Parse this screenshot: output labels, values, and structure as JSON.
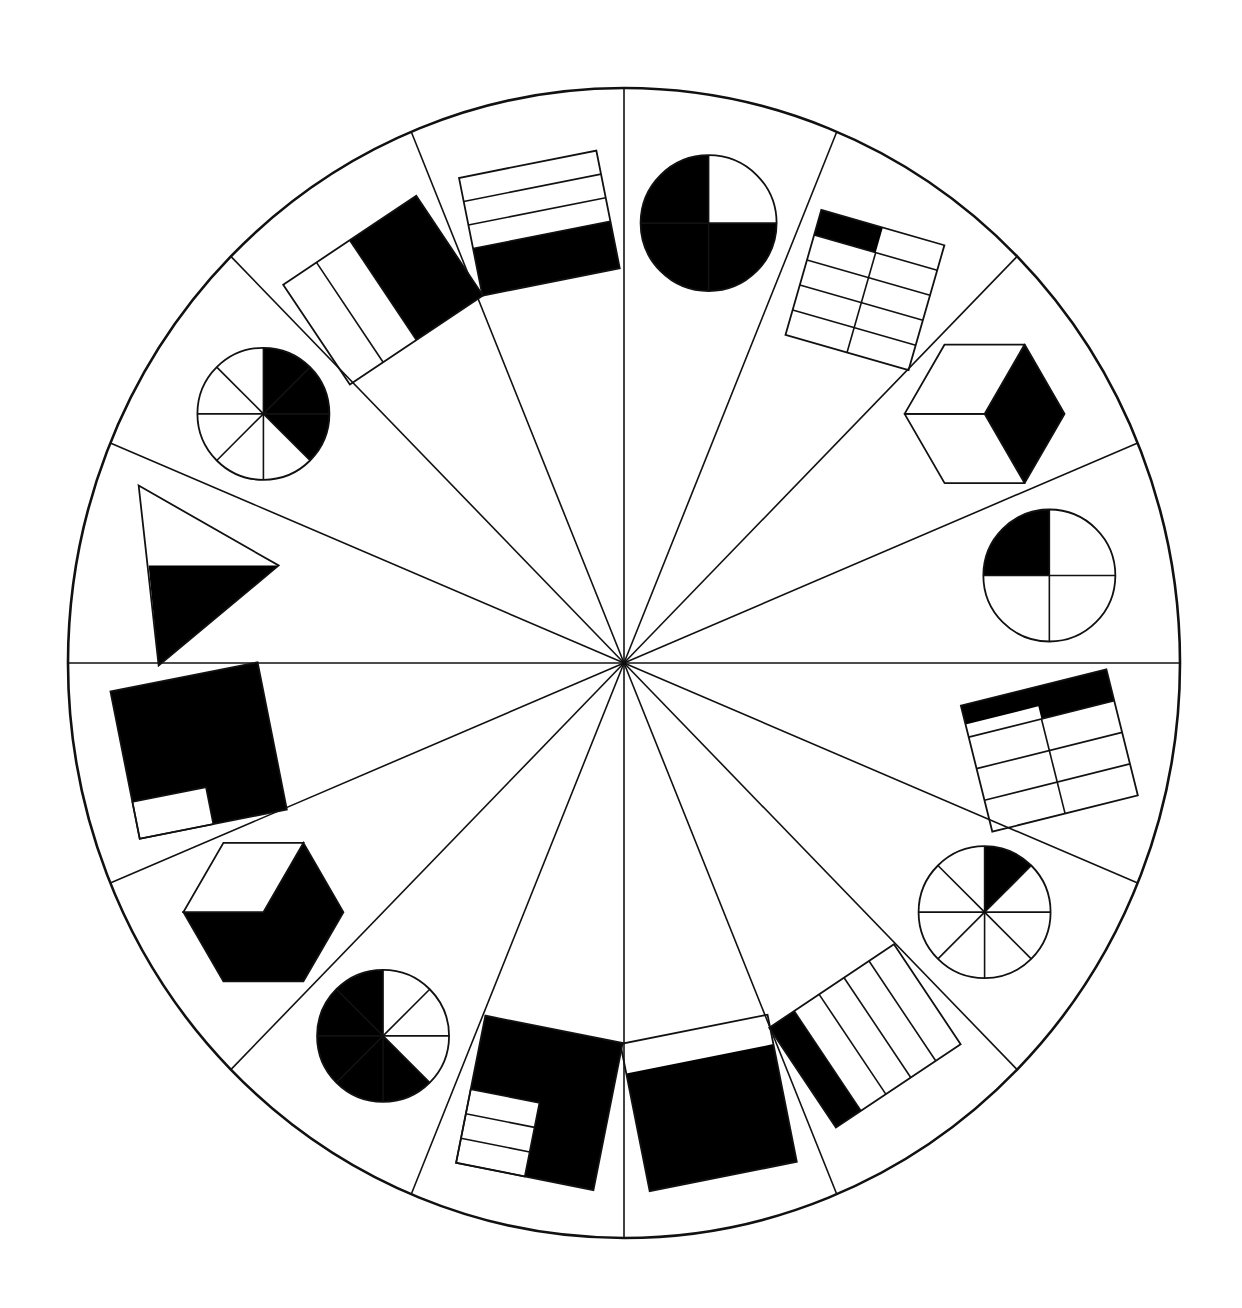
{
  "diagram": {
    "type": "fraction-wheel",
    "colors": {
      "stroke": "#111111",
      "fill_shaded": "#000000",
      "fill_unshaded": "#ffffff",
      "background": "#ffffff"
    },
    "wheel": {
      "cx": 624,
      "cy": 663,
      "rx": 556,
      "ry": 575,
      "segments": 16
    },
    "segments": [
      {
        "index": 0,
        "shape": "circle-sectors",
        "parts": 4,
        "shaded": 3,
        "fraction": "3/4",
        "start_deg": 0
      },
      {
        "index": 1,
        "shape": "grid",
        "rows": 5,
        "cols": 2,
        "shaded": 1,
        "fraction": "1/10"
      },
      {
        "index": 2,
        "shape": "cube",
        "parts": 3,
        "shaded": 1,
        "fraction": "1/3"
      },
      {
        "index": 3,
        "shape": "circle-sectors",
        "parts": 4,
        "shaded": 1,
        "fraction": "1/4"
      },
      {
        "index": 4,
        "shape": "grid-L",
        "rows": 2,
        "cols": 4,
        "shaded": 3,
        "fraction": "3/8"
      },
      {
        "index": 5,
        "shape": "circle-sectors",
        "parts": 8,
        "shaded": 1,
        "fraction": "1/8"
      },
      {
        "index": 6,
        "shape": "strips",
        "parts": 5,
        "shaded": 1,
        "fraction": "1/5"
      },
      {
        "index": 7,
        "shape": "square-notch",
        "parts": 5,
        "shaded": 4,
        "fraction": "4/5"
      },
      {
        "index": 8,
        "shape": "square-L",
        "parts": 4,
        "shaded": 3,
        "fraction": "3/4"
      },
      {
        "index": 9,
        "shape": "circle-sectors",
        "parts": 8,
        "shaded": 5,
        "fraction": "5/8"
      },
      {
        "index": 10,
        "shape": "cube",
        "parts": 3,
        "shaded": 2,
        "fraction": "2/3"
      },
      {
        "index": 11,
        "shape": "square-corner",
        "parts": 8,
        "shaded": 7,
        "fraction": "7/8"
      },
      {
        "index": 12,
        "shape": "triangle",
        "parts": 2,
        "shaded": 1,
        "fraction": "1/2"
      },
      {
        "index": 13,
        "shape": "circle-sectors",
        "parts": 8,
        "shaded": 3,
        "fraction": "3/8"
      },
      {
        "index": 14,
        "shape": "strips",
        "parts": 4,
        "shaded": 2,
        "fraction": "2/4"
      },
      {
        "index": 15,
        "shape": "strips",
        "parts": 5,
        "shaded": 2,
        "fraction": "2/5"
      }
    ]
  }
}
